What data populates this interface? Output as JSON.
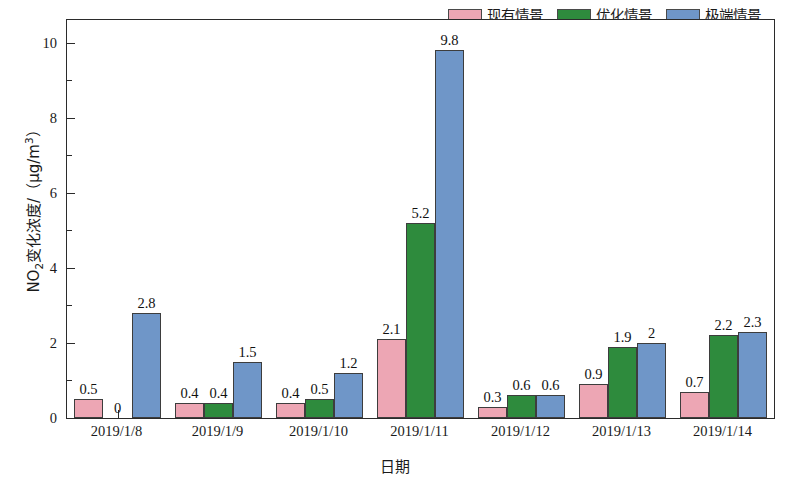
{
  "chart_data": {
    "type": "bar",
    "title": "",
    "xlabel": "日期",
    "ylabel": "NO2变化浓度/（μg/m3）",
    "ylabel_parts": {
      "prefix": "NO",
      "subscript": "2",
      "middle": "变化浓度/（μg/m",
      "superscript": "3",
      "suffix": "）"
    },
    "categories": [
      "2019/1/8",
      "2019/1/9",
      "2019/1/10",
      "2019/1/11",
      "2019/1/12",
      "2019/1/13",
      "2019/1/14"
    ],
    "series": [
      {
        "name": "现有情景",
        "color": "#eda6b4",
        "values": [
          0.5,
          0.4,
          0.4,
          2.1,
          0.3,
          0.9,
          0.7
        ],
        "labels": [
          "0.5",
          "0.4",
          "0.4",
          "2.1",
          "0.3",
          "0.9",
          "0.7"
        ]
      },
      {
        "name": "优化情景",
        "color": "#2e8b3d",
        "values": [
          0,
          0.4,
          0.5,
          5.2,
          0.6,
          1.9,
          2.2
        ],
        "labels": [
          "0",
          "0.4",
          "0.5",
          "5.2",
          "0.6",
          "1.9",
          "2.2"
        ]
      },
      {
        "name": "极端情景",
        "color": "#6f96c8",
        "values": [
          2.8,
          1.5,
          1.2,
          9.8,
          0.6,
          2,
          2.3
        ],
        "labels": [
          "2.8",
          "1.5",
          "1.2",
          "9.8",
          "0.6",
          "2",
          "2.3"
        ]
      }
    ],
    "ylim": [
      0,
      10.6
    ],
    "ytick_major": [
      0,
      2,
      4,
      6,
      8,
      10
    ],
    "ytick_major_labels": [
      "0",
      "2",
      "4",
      "6",
      "8",
      "10"
    ],
    "ytick_minor": [
      1,
      3,
      5,
      7,
      9
    ],
    "grid": false,
    "legend_position": "top-right",
    "frame": "box"
  }
}
